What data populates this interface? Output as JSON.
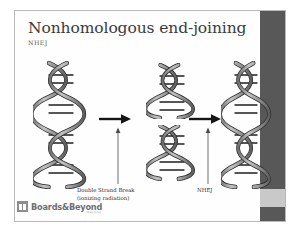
{
  "slide": {
    "title": "Nonhomologous end-joining",
    "subtitle": "NHEJ",
    "colors": {
      "sidebar_dark": "#585858",
      "sidebar_light": "#c9c9c9",
      "frame_border": "#b9b9b9",
      "title_text": "#3b3b3b",
      "dna_fill": "#9a9a9a",
      "dna_outline": "#2b2b2b"
    }
  },
  "diagram": {
    "type": "process-flow",
    "steps": [
      {
        "id": "dna-intact",
        "label": "intact DNA double helix",
        "icon": "dna-helix-icon"
      },
      {
        "id": "dna-broken",
        "label": "DNA double helix cleaved into two fragments",
        "icon": "dna-helix-broken-icon"
      },
      {
        "id": "dna-repaired",
        "label": "rejoined DNA double helix",
        "icon": "dna-helix-icon"
      }
    ],
    "arrows": [
      {
        "id": "arrow-1",
        "direction": "right",
        "icon": "arrow-right-icon"
      },
      {
        "id": "arrow-2",
        "direction": "right",
        "icon": "arrow-right-icon"
      },
      {
        "id": "arrow-v-1",
        "direction": "up",
        "icon": "arrow-up-icon"
      },
      {
        "id": "arrow-v-2",
        "direction": "up",
        "icon": "arrow-up-icon"
      }
    ],
    "captions": {
      "double_strand_break_line1": "Double Strand Break",
      "double_strand_break_line2": "(ionizing radiation)",
      "nhej": "NHEJ"
    }
  },
  "footer": {
    "logo_text": "Boards&Beyond",
    "logo_subtext": "teaching"
  }
}
